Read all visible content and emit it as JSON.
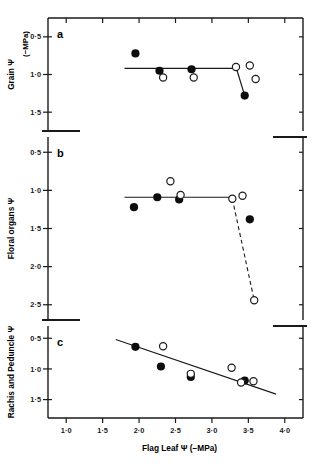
{
  "figure": {
    "xaxis": {
      "title": "Flag Leaf Ψ (−MPa)",
      "tick_labels": [
        "1·0",
        "1·5",
        "2·0",
        "2·5",
        "3·0",
        "3·5",
        "4·0"
      ],
      "tick_values": [
        1.0,
        1.5,
        2.0,
        2.5,
        3.0,
        3.5,
        4.0
      ],
      "min": 0.75,
      "max": 4.25
    },
    "units_label": "(−MPa)",
    "panels": [
      {
        "letter": "a",
        "ylabel": "Grain Ψ",
        "tick_labels": [
          "0·5",
          "1·0",
          "1·5"
        ],
        "tick_values": [
          0.5,
          1.0,
          1.5
        ],
        "ymin": 0.25,
        "ymax": 1.75
      },
      {
        "letter": "b",
        "ylabel": "Floral organs Ψ",
        "tick_labels": [
          "0·5",
          "1·0",
          "1·5",
          "2·0",
          "2·5"
        ],
        "tick_values": [
          0.5,
          1.0,
          1.5,
          2.0,
          2.5
        ],
        "ymin": 0.3,
        "ymax": 2.7
      },
      {
        "letter": "c",
        "ylabel": "Rachis and Peduncle Ψ",
        "tick_labels": [
          "0·5",
          "1·0",
          "1·5"
        ],
        "tick_values": [
          0.5,
          1.0,
          1.5
        ],
        "ymin": 0.3,
        "ymax": 1.8
      }
    ]
  },
  "chart_data": [
    {
      "type": "scatter",
      "panel": "a",
      "title": "",
      "xlabel": "Flag Leaf Ψ (−MPa)",
      "ylabel": "Grain Ψ (−MPa)",
      "xlim": [
        0.75,
        4.25
      ],
      "ylim": [
        1.75,
        0.25
      ],
      "grid": false,
      "legend": "none",
      "series": [
        {
          "name": "closed-circles",
          "marker": "filled",
          "points": [
            {
              "x": 1.95,
              "y": 0.72
            },
            {
              "x": 2.28,
              "y": 0.95
            },
            {
              "x": 2.72,
              "y": 0.93
            },
            {
              "x": 3.45,
              "y": 1.28
            }
          ]
        },
        {
          "name": "open-circles",
          "marker": "open",
          "points": [
            {
              "x": 2.33,
              "y": 1.04
            },
            {
              "x": 2.75,
              "y": 1.04
            },
            {
              "x": 3.33,
              "y": 0.9
            },
            {
              "x": 3.52,
              "y": 0.88
            },
            {
              "x": 3.6,
              "y": 1.06
            }
          ]
        }
      ],
      "lines": [
        {
          "name": "plateau-line",
          "style": "solid",
          "points": [
            {
              "x": 1.8,
              "y": 0.92
            },
            {
              "x": 3.33,
              "y": 0.92
            }
          ]
        },
        {
          "name": "drop-line",
          "style": "solid",
          "points": [
            {
              "x": 3.33,
              "y": 0.9
            },
            {
              "x": 3.45,
              "y": 1.28
            }
          ]
        }
      ]
    },
    {
      "type": "scatter",
      "panel": "b",
      "title": "",
      "xlabel": "Flag Leaf Ψ (−MPa)",
      "ylabel": "Floral organs Ψ (−MPa)",
      "xlim": [
        0.75,
        4.25
      ],
      "ylim": [
        2.7,
        0.3
      ],
      "grid": false,
      "legend": "none",
      "series": [
        {
          "name": "closed-circles",
          "marker": "filled",
          "points": [
            {
              "x": 1.93,
              "y": 1.22
            },
            {
              "x": 2.25,
              "y": 1.09
            },
            {
              "x": 2.55,
              "y": 1.12
            },
            {
              "x": 3.52,
              "y": 1.38
            }
          ]
        },
        {
          "name": "open-circles",
          "marker": "open",
          "points": [
            {
              "x": 2.43,
              "y": 0.88
            },
            {
              "x": 2.57,
              "y": 1.06
            },
            {
              "x": 3.28,
              "y": 1.11
            },
            {
              "x": 3.42,
              "y": 1.07
            },
            {
              "x": 3.58,
              "y": 2.44
            }
          ]
        }
      ],
      "lines": [
        {
          "name": "plateau-line",
          "style": "solid",
          "points": [
            {
              "x": 1.8,
              "y": 1.09
            },
            {
              "x": 3.28,
              "y": 1.09
            }
          ]
        },
        {
          "name": "decline-line",
          "style": "dashed",
          "points": [
            {
              "x": 3.28,
              "y": 1.11
            },
            {
              "x": 3.58,
              "y": 2.44
            }
          ]
        }
      ]
    },
    {
      "type": "scatter",
      "panel": "c",
      "title": "",
      "xlabel": "Flag Leaf Ψ (−MPa)",
      "ylabel": "Rachis and Peduncle Ψ (−MPa)",
      "xlim": [
        0.75,
        4.25
      ],
      "ylim": [
        1.8,
        0.3
      ],
      "grid": false,
      "legend": "none",
      "series": [
        {
          "name": "closed-circles",
          "marker": "filled",
          "points": [
            {
              "x": 1.95,
              "y": 0.64
            },
            {
              "x": 2.3,
              "y": 0.96
            },
            {
              "x": 2.71,
              "y": 1.13
            },
            {
              "x": 3.45,
              "y": 1.19
            }
          ]
        },
        {
          "name": "open-circles",
          "marker": "open",
          "points": [
            {
              "x": 2.33,
              "y": 0.63
            },
            {
              "x": 2.71,
              "y": 1.08
            },
            {
              "x": 3.27,
              "y": 0.98
            },
            {
              "x": 3.4,
              "y": 1.22
            },
            {
              "x": 3.57,
              "y": 1.2
            }
          ]
        }
      ],
      "lines": [
        {
          "name": "regression-line",
          "style": "solid",
          "points": [
            {
              "x": 1.68,
              "y": 0.52
            },
            {
              "x": 3.88,
              "y": 1.41
            }
          ]
        }
      ]
    }
  ]
}
